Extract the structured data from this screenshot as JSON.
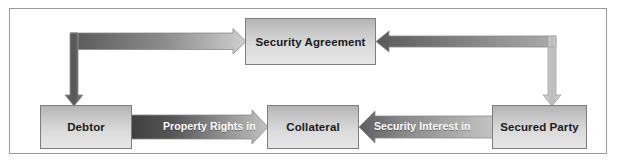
{
  "diagram": {
    "background_color": "#ffffff",
    "frame_border_color": "#9a9a9a",
    "nodes": [
      {
        "id": "security-agreement",
        "label": "Security Agreement"
      },
      {
        "id": "debtor",
        "label": "Debtor"
      },
      {
        "id": "collateral",
        "label": "Collateral"
      },
      {
        "id": "secured-party",
        "label": "Secured Party"
      }
    ],
    "edges": [
      {
        "id": "debtor-to-collateral",
        "label": "Property Rights in",
        "from": "Debtor",
        "to": "Collateral",
        "direction": "right",
        "color_start": "#4a4a4a",
        "color_end": "#b9b9b9"
      },
      {
        "id": "secured-party-to-collateral",
        "label": "Security Interest in",
        "from": "Secured Party",
        "to": "Collateral",
        "direction": "left",
        "color_start": "#555555",
        "color_end": "#b9b9b9"
      },
      {
        "id": "security-agreement-to-debtor",
        "label": "",
        "from": "Security Agreement",
        "to": "Debtor",
        "direction": "elbow-left-down",
        "color_start": "#8f8f8f",
        "color_end": "#5d5d5d"
      },
      {
        "id": "secured-party-to-security-agreement",
        "label": "",
        "from": "Secured Party",
        "to": "Security Agreement",
        "direction": "elbow-right-up",
        "color_start": "#6d6d6d",
        "color_end": "#bdbdbd"
      },
      {
        "id": "security-agreement-to-secured-party",
        "label": "",
        "from": "Security Agreement",
        "to": "Secured Party",
        "direction": "elbow-right-down",
        "color_start": "#c0c0c0",
        "color_end": "#bdbdbd"
      }
    ],
    "node_fill_top": "#b4b4b4",
    "node_fill_bottom": "#e6e6e6",
    "node_border_color": "#7d7d7d",
    "label_text_color": "#ffffff",
    "node_text_color": "#1b1b1b"
  }
}
